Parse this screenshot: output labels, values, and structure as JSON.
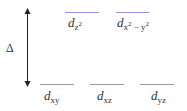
{
  "diagram": {
    "gap_symbol": "Δ",
    "upper_levels": [
      {
        "orbital": "d",
        "subscript": "z",
        "superscript": "2"
      },
      {
        "orbital": "d",
        "subscript": "x",
        "sup1": "2",
        "mid": " − y",
        "sup2": "2"
      }
    ],
    "lower_levels": [
      {
        "orbital": "d",
        "subscript": "xy"
      },
      {
        "orbital": "d",
        "subscript": "xz"
      },
      {
        "orbital": "d",
        "subscript": "yz"
      }
    ],
    "colors": {
      "upper_line": "#8f92dd",
      "lower_line": "#9a9a9a",
      "arrow": "#222222"
    }
  }
}
